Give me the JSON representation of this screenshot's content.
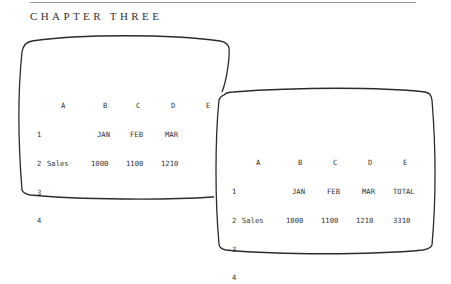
{
  "header": {
    "chapter": "CHAPTER THREE"
  },
  "screen1": {
    "column_headers": [
      "A",
      "B",
      "C",
      "D",
      "E"
    ],
    "rows": [
      {
        "num": "1",
        "cells": [
          "",
          "JAN",
          "FEB",
          "MAR"
        ]
      },
      {
        "num": "2",
        "cells": [
          "Sales",
          "1000",
          "1100",
          "1210"
        ]
      },
      {
        "num": "3",
        "cells": [
          "",
          "",
          "",
          ""
        ]
      },
      {
        "num": "4",
        "cells": [
          "",
          "",
          "",
          ""
        ]
      }
    ]
  },
  "screen2": {
    "column_headers": [
      "A",
      "B",
      "C",
      "D",
      "E"
    ],
    "rows": [
      {
        "num": "1",
        "cells": [
          "",
          "JAN",
          "FEB",
          "MAR",
          "TOTAL"
        ]
      },
      {
        "num": "2",
        "cells": [
          "Sales",
          "1000",
          "1100",
          "1210",
          "3310"
        ]
      },
      {
        "num": "3",
        "cells": [
          "",
          "",
          "",
          "",
          ""
        ]
      },
      {
        "num": "4",
        "cells": [
          "",
          "",
          "",
          "",
          ""
        ]
      }
    ]
  }
}
